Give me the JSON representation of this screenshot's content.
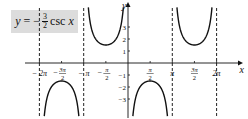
{
  "chart_data": {
    "type": "line",
    "equation": {
      "lhs": "y",
      "eq": "=",
      "sign": "−",
      "numerator": "3",
      "denominator": "2",
      "func": "csc",
      "var": "x"
    },
    "xlabel": "x",
    "ylabel": "y",
    "xlim": [
      -7.0,
      7.0
    ],
    "ylim": [
      -4.5,
      5.0
    ],
    "x_ticks": [
      {
        "value": -6.2832,
        "label": "−2π"
      },
      {
        "value": -4.7124,
        "label": "−3π/2"
      },
      {
        "value": -3.1416,
        "label": "−π"
      },
      {
        "value": -1.5708,
        "label": "−π/2"
      },
      {
        "value": 1.5708,
        "label": "π/2"
      },
      {
        "value": 3.1416,
        "label": "π"
      },
      {
        "value": 4.7124,
        "label": "3π/2"
      },
      {
        "value": 6.2832,
        "label": "2π"
      }
    ],
    "y_ticks": [
      {
        "value": 3,
        "label": "3"
      },
      {
        "value": 2,
        "label": "2"
      },
      {
        "value": 1,
        "label": "1"
      },
      {
        "value": -1,
        "label": "−1"
      },
      {
        "value": -2,
        "label": "−2"
      },
      {
        "value": -3,
        "label": "−3"
      }
    ],
    "asymptotes_x": [
      -6.2832,
      -3.1416,
      3.1416,
      6.2832
    ],
    "series": [
      {
        "name": "y = -3/2 csc x",
        "function": "-1.5/sin(x)",
        "domain": [
          -6.2832,
          6.2832
        ],
        "local_extrema": [
          {
            "x": -4.7124,
            "y": -1.5
          },
          {
            "x": -1.5708,
            "y": 1.5
          },
          {
            "x": 1.5708,
            "y": -1.5
          },
          {
            "x": 4.7124,
            "y": 1.5
          }
        ]
      }
    ],
    "grid": false,
    "colors": {
      "curve": "#111111",
      "axes": "#111111",
      "asymptote": "#222222",
      "label_box": "#dcdcdc"
    }
  }
}
